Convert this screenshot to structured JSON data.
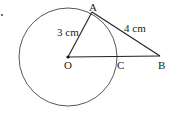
{
  "diagram": {
    "points": {
      "A": {
        "label": "A",
        "x": 92,
        "y": 13
      },
      "B": {
        "label": "B",
        "x": 160,
        "y": 57
      },
      "C": {
        "label": "C",
        "x": 117,
        "y": 57
      },
      "O": {
        "label": "O",
        "x": 68,
        "y": 57
      }
    },
    "circle": {
      "center": "O",
      "radius": 49
    },
    "segments": [
      {
        "from": "O",
        "to": "A",
        "label": "3 cm"
      },
      {
        "from": "A",
        "to": "B",
        "label": "4 cm"
      },
      {
        "from": "O",
        "to": "B",
        "label": ""
      }
    ],
    "labels": {
      "OA": "3 cm",
      "AB": "4 cm",
      "A": "A",
      "B": "B",
      "C": "C",
      "O": "O"
    },
    "colors": {
      "stroke": "#333333",
      "text": "#222222"
    }
  }
}
